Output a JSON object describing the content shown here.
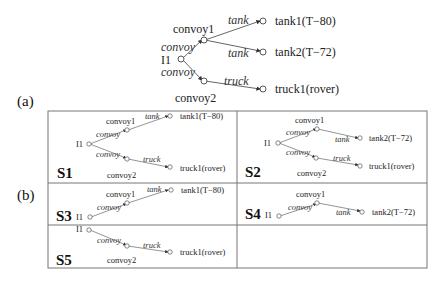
{
  "captions": {
    "a": "(a)",
    "b": "(b)"
  },
  "main_tree": {
    "root": "I1",
    "nodes": {
      "convoy1": "convoy1",
      "convoy2": "convoy2",
      "tank1": "tank1(T−80)",
      "tank2": "tank2(T−72)",
      "truck1": "truck1(rover)"
    },
    "edges": {
      "convoy": "convoy",
      "tank": "tank",
      "truck": "truck"
    }
  },
  "panels": [
    {
      "id": "S1",
      "label": "S1"
    },
    {
      "id": "S2",
      "label": "S2"
    },
    {
      "id": "S3",
      "label": "S3"
    },
    {
      "id": "S4",
      "label": "S4"
    },
    {
      "id": "S5",
      "label": "S5"
    }
  ]
}
